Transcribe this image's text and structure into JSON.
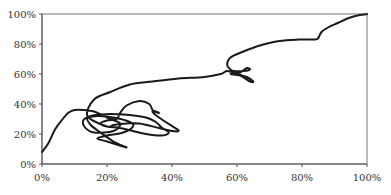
{
  "chart_data": {
    "type": "line",
    "title": "",
    "xlabel": "",
    "ylabel": "",
    "xlim": [
      0,
      100
    ],
    "ylim": [
      0,
      100
    ],
    "grid": false,
    "legend": null,
    "x_ticks": [
      "0%",
      "20%",
      "40%",
      "60%",
      "80%",
      "100%"
    ],
    "y_ticks": [
      "0%",
      "20%",
      "40%",
      "60%",
      "80%",
      "100%"
    ],
    "series": [
      {
        "name": "trajectory",
        "color": "#1a1a1a",
        "points": [
          [
            0,
            8
          ],
          [
            2,
            14
          ],
          [
            4,
            23
          ],
          [
            6,
            29
          ],
          [
            8,
            34
          ],
          [
            10,
            36
          ],
          [
            13,
            36
          ],
          [
            16,
            35
          ],
          [
            20,
            31
          ],
          [
            24,
            27
          ],
          [
            22,
            22
          ],
          [
            16,
            21
          ],
          [
            13,
            25
          ],
          [
            13,
            30
          ],
          [
            17,
            32
          ],
          [
            22,
            31
          ],
          [
            27,
            28
          ],
          [
            28,
            25
          ],
          [
            25,
            21
          ],
          [
            20,
            19
          ],
          [
            17,
            17
          ],
          [
            20,
            15
          ],
          [
            26,
            11
          ],
          [
            22,
            15
          ],
          [
            18,
            21
          ],
          [
            15,
            26
          ],
          [
            14,
            31
          ],
          [
            18,
            33
          ],
          [
            25,
            33
          ],
          [
            32,
            31
          ],
          [
            35,
            28
          ],
          [
            37,
            24
          ],
          [
            39,
            21
          ],
          [
            37,
            19
          ],
          [
            32,
            20
          ],
          [
            28,
            22
          ],
          [
            24,
            24
          ],
          [
            20,
            25
          ],
          [
            18,
            27
          ],
          [
            20,
            29
          ],
          [
            23,
            30
          ],
          [
            24,
            34
          ],
          [
            26,
            39
          ],
          [
            30,
            42
          ],
          [
            33,
            40
          ],
          [
            34,
            36
          ],
          [
            35,
            35
          ],
          [
            36,
            34
          ],
          [
            34,
            35
          ],
          [
            36,
            31
          ],
          [
            41,
            24
          ],
          [
            42,
            22
          ],
          [
            40,
            22
          ],
          [
            36,
            24
          ],
          [
            30,
            27
          ],
          [
            26,
            27
          ],
          [
            22,
            26
          ],
          [
            20,
            25
          ],
          [
            14,
            32
          ],
          [
            16,
            43
          ],
          [
            21,
            48
          ],
          [
            27,
            53
          ],
          [
            34,
            55
          ],
          [
            42,
            57
          ],
          [
            50,
            58
          ],
          [
            55,
            60
          ],
          [
            57,
            62
          ],
          [
            60,
            60
          ],
          [
            63,
            58
          ],
          [
            65,
            55
          ],
          [
            64,
            55
          ],
          [
            61,
            59
          ],
          [
            58,
            60
          ],
          [
            61,
            61
          ],
          [
            63,
            64
          ],
          [
            64,
            63
          ],
          [
            62,
            62
          ],
          [
            59,
            62
          ],
          [
            58,
            63
          ],
          [
            57,
            66
          ],
          [
            58,
            71
          ],
          [
            62,
            75
          ],
          [
            67,
            79
          ],
          [
            73,
            82
          ],
          [
            79,
            83
          ],
          [
            84,
            83
          ],
          [
            85,
            84
          ],
          [
            86,
            88
          ],
          [
            88,
            91
          ],
          [
            91,
            94
          ],
          [
            94,
            97
          ],
          [
            97,
            99
          ],
          [
            100,
            100
          ]
        ]
      }
    ]
  }
}
